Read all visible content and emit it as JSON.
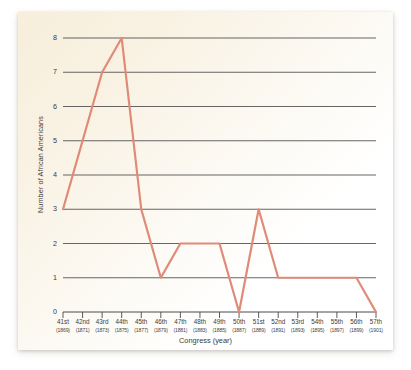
{
  "chart_data": {
    "type": "line",
    "title": "",
    "xlabel": "Congress (year)",
    "ylabel": "Number of African Americans",
    "ylim": [
      0,
      8
    ],
    "yticks": [
      0,
      1,
      2,
      3,
      4,
      5,
      6,
      7,
      8
    ],
    "grid": true,
    "legend": false,
    "line_color": "#e08a78",
    "categories": [
      "41st",
      "42nd",
      "43rd",
      "44th",
      "45th",
      "46th",
      "47th",
      "48th",
      "49th",
      "50th",
      "51st",
      "52nd",
      "53rd",
      "54th",
      "55th",
      "56th",
      "57th"
    ],
    "years": [
      "(1869)",
      "(1871)",
      "(1873)",
      "(1875)",
      "(1877)",
      "(1879)",
      "(1881)",
      "(1883)",
      "(1885)",
      "(1887)",
      "(1889)",
      "(1891)",
      "(1893)",
      "(1895)",
      "(1897)",
      "(1899)",
      "(1901)"
    ],
    "values": [
      3,
      5,
      7,
      8,
      3,
      1,
      2,
      2,
      2,
      0,
      3,
      1,
      1,
      1,
      1,
      1,
      0
    ],
    "points": [
      {
        "congress": "41st",
        "year": "(1869)",
        "value": 3
      },
      {
        "congress": "42nd",
        "year": "(1871)",
        "value": 5
      },
      {
        "congress": "43rd",
        "year": "(1873)",
        "value": 7
      },
      {
        "congress": "44th",
        "year": "(1875)",
        "value": 8
      },
      {
        "congress": "45th",
        "year": "(1877)",
        "value": 3
      },
      {
        "congress": "46th",
        "year": "(1879)",
        "value": 1
      },
      {
        "congress": "47th",
        "year": "(1881)",
        "value": 2
      },
      {
        "congress": "48th",
        "year": "(1883)",
        "value": 2
      },
      {
        "congress": "49th",
        "year": "(1885)",
        "value": 2
      },
      {
        "congress": "50th",
        "year": "(1887)",
        "value": 0
      },
      {
        "congress": "51st",
        "year": "(1889)",
        "value": 3
      },
      {
        "congress": "52nd",
        "year": "(1891)",
        "value": 1
      },
      {
        "congress": "53rd",
        "year": "(1893)",
        "value": 1
      },
      {
        "congress": "54th",
        "year": "(1895)",
        "value": 1
      },
      {
        "congress": "55th",
        "year": "(1897)",
        "value": 1
      },
      {
        "congress": "56th",
        "year": "(1899)",
        "value": 1
      },
      {
        "congress": "57th",
        "year": "(1901)",
        "value": 0
      }
    ]
  },
  "colors": {
    "line": "#e08a78",
    "grid": "#4a4a4a",
    "axis": "#4a4a4a",
    "text": "#3d3a33",
    "panel_cream": "#f7eedb",
    "page_bg": "#ffffff"
  }
}
